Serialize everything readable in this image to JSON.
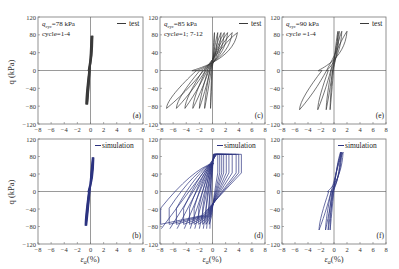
{
  "figure": {
    "ylabel": "q (kPa)",
    "xlabel": "εa(%)",
    "xlabel_main": "ε",
    "xlabel_sub": "a",
    "xlabel_unit": "(%)",
    "colors": {
      "test": "#3a3a3a",
      "simulation": "#2c3380",
      "axis": "#555555",
      "frame": "#777777"
    }
  },
  "chart_data": [
    {
      "id": "a",
      "type": "line",
      "panel_label": "(a)",
      "legend": "test",
      "series_kind": "test",
      "annotation": [
        "q_cyc=78 kPa",
        "cycle=1-4"
      ],
      "q_cyc_value": "=78 kPa",
      "cycle_text": "cycle=1-4",
      "xlim": [
        -8,
        8
      ],
      "ylim": [
        -120,
        120
      ],
      "xticks": [
        -8,
        -6,
        -4,
        -2,
        0,
        2,
        4,
        6,
        8
      ],
      "yticks": [
        -120,
        -80,
        -40,
        0,
        40,
        80,
        120
      ],
      "loops": [
        {
          "xmin": -0.7,
          "xmax": 0.1,
          "qmin": -76,
          "qmax": 78
        },
        {
          "xmin": -0.6,
          "xmax": 0.2,
          "qmin": -76,
          "qmax": 78
        },
        {
          "xmin": -0.5,
          "xmax": 0.3,
          "qmin": -76,
          "qmax": 78
        },
        {
          "xmin": -0.45,
          "xmax": 0.35,
          "qmin": -76,
          "qmax": 78
        }
      ]
    },
    {
      "id": "c",
      "type": "line",
      "panel_label": "(c)",
      "legend": "test",
      "series_kind": "test",
      "annotation": [
        "q_cyc=85 kPa",
        "cycle=1; 7-12"
      ],
      "q_cyc_value": "=85 kPa",
      "cycle_text": "cycle=1; 7-12",
      "xlim": [
        -8,
        8
      ],
      "ylim": [
        -120,
        120
      ],
      "xticks": [
        -8,
        -6,
        -4,
        -2,
        0,
        2,
        4,
        6,
        8
      ],
      "yticks": [
        -120,
        -80,
        -40,
        0,
        40,
        80,
        120
      ],
      "loops": [
        {
          "xmin": -0.3,
          "xmax": 0.3,
          "qmin": -85,
          "qmax": 85
        },
        {
          "xmin": -1.2,
          "xmax": 0.8,
          "qmin": -85,
          "qmax": 85
        },
        {
          "xmin": -2.0,
          "xmax": 1.3,
          "qmin": -85,
          "qmax": 85
        },
        {
          "xmin": -3.0,
          "xmax": 1.8,
          "qmin": -85,
          "qmax": 85
        },
        {
          "xmin": -4.2,
          "xmax": 2.3,
          "qmin": -85,
          "qmax": 85
        },
        {
          "xmin": -5.5,
          "xmax": 3.0,
          "qmin": -85,
          "qmax": 85
        },
        {
          "xmin": -7.0,
          "xmax": 3.8,
          "qmin": -85,
          "qmax": 85
        }
      ]
    },
    {
      "id": "e",
      "type": "line",
      "panel_label": "(e)",
      "legend": "test",
      "series_kind": "test",
      "annotation": [
        "q_cyc=90 kPa",
        "cycle=1-4"
      ],
      "q_cyc_value": "=90 kPa",
      "cycle_text": "cycle =1-4",
      "xlim": [
        -8,
        8
      ],
      "ylim": [
        -120,
        120
      ],
      "xticks": [
        -8,
        -6,
        -4,
        -2,
        0,
        2,
        4,
        6,
        8
      ],
      "yticks": [
        -120,
        -80,
        -40,
        0,
        40,
        80,
        120
      ],
      "loops": [
        {
          "xmin": -0.6,
          "xmax": 0.6,
          "qmin": -88,
          "qmax": 88
        },
        {
          "xmin": -1.2,
          "xmax": 0.8,
          "qmin": -88,
          "qmax": 88
        },
        {
          "xmin": -2.5,
          "xmax": 1.2,
          "qmin": -88,
          "qmax": 88
        },
        {
          "xmin": -5.3,
          "xmax": 2.0,
          "qmin": -88,
          "qmax": 88
        }
      ]
    },
    {
      "id": "b",
      "type": "line",
      "panel_label": "(b)",
      "legend": "simulation",
      "series_kind": "simulation",
      "xlim": [
        -8,
        8
      ],
      "ylim": [
        -120,
        120
      ],
      "xticks": [
        -8,
        -6,
        -4,
        -2,
        0,
        2,
        4,
        6,
        8
      ],
      "yticks": [
        -120,
        -80,
        -40,
        0,
        40,
        80,
        120
      ],
      "loops": [
        {
          "xmin": -0.8,
          "xmax": 0.3,
          "qmin": -78,
          "qmax": 78
        },
        {
          "xmin": -0.7,
          "xmax": 0.4,
          "qmin": -78,
          "qmax": 78
        },
        {
          "xmin": -0.6,
          "xmax": 0.5,
          "qmin": -78,
          "qmax": 78
        }
      ]
    },
    {
      "id": "d",
      "type": "line",
      "panel_label": "(d)",
      "legend": "simulation",
      "series_kind": "simulation",
      "xlim": [
        -8,
        8
      ],
      "ylim": [
        -120,
        120
      ],
      "xticks": [
        -8,
        -6,
        -4,
        -2,
        0,
        2,
        4,
        6,
        8
      ],
      "yticks": [
        -120,
        -80,
        -40,
        0,
        40,
        80,
        120
      ],
      "loops": [
        {
          "xmin": -0.5,
          "xmax": 0.8,
          "qmin": -85,
          "qmax": 85
        },
        {
          "xmin": -1.0,
          "xmax": 1.1,
          "qmin": -85,
          "qmax": 85
        },
        {
          "xmin": -1.5,
          "xmax": 1.4,
          "qmin": -85,
          "qmax": 85
        },
        {
          "xmin": -2.1,
          "xmax": 1.7,
          "qmin": -85,
          "qmax": 85
        },
        {
          "xmin": -2.8,
          "xmax": 2.1,
          "qmin": -85,
          "qmax": 85
        },
        {
          "xmin": -3.5,
          "xmax": 2.5,
          "qmin": -85,
          "qmax": 85
        },
        {
          "xmin": -4.4,
          "xmax": 3.0,
          "qmin": -85,
          "qmax": 85
        },
        {
          "xmin": -5.5,
          "xmax": 3.6,
          "qmin": -85,
          "qmax": 85
        },
        {
          "xmin": -6.6,
          "xmax": 4.0,
          "qmin": -85,
          "qmax": 85
        },
        {
          "xmin": -7.9,
          "xmax": 4.4,
          "qmin": -85,
          "qmax": 85
        }
      ]
    },
    {
      "id": "f",
      "type": "line",
      "panel_label": "(f)",
      "legend": "simulation",
      "series_kind": "simulation",
      "xlim": [
        -8,
        8
      ],
      "ylim": [
        -120,
        120
      ],
      "xticks": [
        -8,
        -6,
        -4,
        -2,
        0,
        2,
        4,
        6,
        8
      ],
      "yticks": [
        -120,
        -80,
        -40,
        0,
        40,
        80,
        120
      ],
      "loops": [
        {
          "xmin": -0.6,
          "xmax": 1.0,
          "qmin": -88,
          "qmax": 90
        },
        {
          "xmin": -0.9,
          "xmax": 1.1,
          "qmin": -88,
          "qmax": 90
        },
        {
          "xmin": -1.3,
          "xmax": 1.2,
          "qmin": -88,
          "qmax": 90
        },
        {
          "xmin": -2.3,
          "xmax": 1.4,
          "qmin": -88,
          "qmax": 90
        }
      ]
    }
  ]
}
